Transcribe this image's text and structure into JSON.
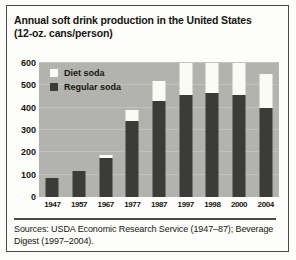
{
  "chart_data": {
    "type": "bar",
    "subtype": "stacked-bar",
    "title": "Annual soft drink production in the United States (12-oz. cans/person)",
    "title_lines": [
      "Annual soft drink production in the United States",
      "(12-oz. cans/person)"
    ],
    "xlabel": "",
    "ylabel": "",
    "ylim": [
      0,
      600
    ],
    "yticks": [
      0,
      100,
      200,
      300,
      400,
      500,
      600
    ],
    "ytick_labels": [
      "0",
      "100",
      "200",
      "300",
      "400",
      "500",
      "600"
    ],
    "grid": true,
    "grid_axis": "y",
    "legend_position": "upper-left-inside",
    "categories": [
      "1947",
      "1957",
      "1967",
      "1977",
      "1987",
      "1997",
      "1998",
      "2000",
      "2004"
    ],
    "series": [
      {
        "name": "Regular soda",
        "color": "#3b3b39",
        "values": [
          85,
          115,
          175,
          340,
          430,
          455,
          465,
          455,
          400
        ]
      },
      {
        "name": "Diet soda",
        "color": "#fbfbf6",
        "values": [
          0,
          0,
          15,
          50,
          90,
          145,
          135,
          145,
          150
        ]
      }
    ],
    "totals": [
      85,
      115,
      190,
      390,
      520,
      600,
      600,
      600,
      550
    ],
    "plot_background": "#b2b2ae",
    "annotations": []
  },
  "legend": {
    "items": [
      {
        "label": "Diet soda",
        "swatch": "diet"
      },
      {
        "label": "Regular soda",
        "swatch": "regular"
      }
    ]
  },
  "source": {
    "text": "Sources: USDA Economic Research Service (1947–87); Beverage Digest (1997–2004)."
  }
}
